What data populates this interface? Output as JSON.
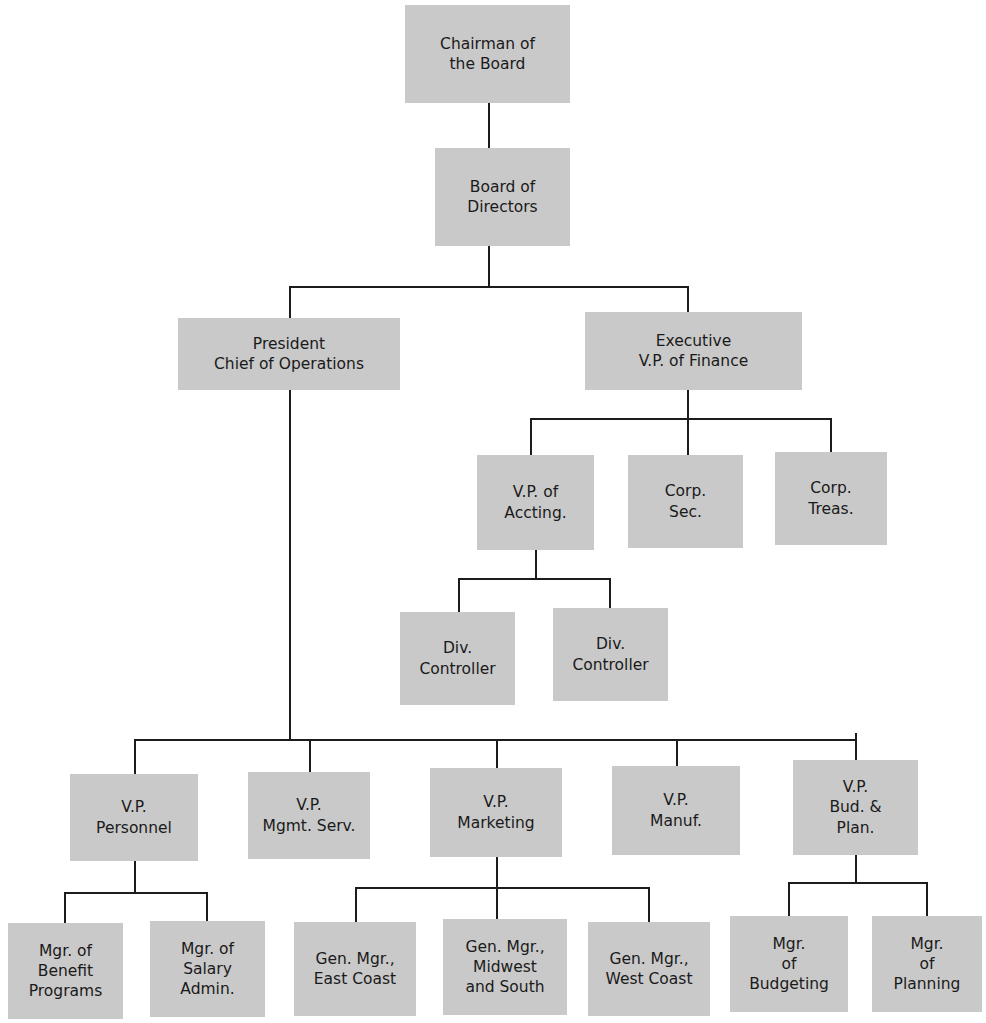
{
  "document": {
    "title": "Corporate Organization Chart",
    "type": "org-chart",
    "colors": {
      "node_fill": "#c9c9c9",
      "connector": "#1c1c1c",
      "background": "#ffffff",
      "text": "#1a1a1a"
    }
  },
  "nodes": {
    "chairman": {
      "label": "Chairman of\nthe Board",
      "x": 405,
      "y": 5,
      "w": 165,
      "h": 98
    },
    "board": {
      "label": "Board of\nDirectors",
      "x": 435,
      "y": 148,
      "w": 135,
      "h": 98
    },
    "president": {
      "label": "President\nChief of Operations",
      "x": 178,
      "y": 318,
      "w": 222,
      "h": 72
    },
    "exec_vp_finance": {
      "label": "Executive\nV.P. of Finance",
      "x": 585,
      "y": 312,
      "w": 217,
      "h": 78
    },
    "vp_accting": {
      "label": "V.P. of\nAccting.",
      "x": 477,
      "y": 455,
      "w": 117,
      "h": 95
    },
    "corp_sec": {
      "label": "Corp.\nSec.",
      "x": 628,
      "y": 455,
      "w": 115,
      "h": 93
    },
    "corp_treas": {
      "label": "Corp.\nTreas.",
      "x": 775,
      "y": 452,
      "w": 112,
      "h": 93
    },
    "div_controller_1": {
      "label": "Div.\nController",
      "x": 400,
      "y": 612,
      "w": 115,
      "h": 93
    },
    "div_controller_2": {
      "label": "Div.\nController",
      "x": 553,
      "y": 608,
      "w": 115,
      "h": 93
    },
    "vp_personnel": {
      "label": "V.P.\nPersonnel",
      "x": 70,
      "y": 774,
      "w": 128,
      "h": 87
    },
    "vp_mgmt_serv": {
      "label": "V.P.\nMgmt. Serv.",
      "x": 248,
      "y": 772,
      "w": 122,
      "h": 87
    },
    "vp_marketing": {
      "label": "V.P.\nMarketing",
      "x": 430,
      "y": 768,
      "w": 132,
      "h": 89
    },
    "vp_manuf": {
      "label": "V.P.\nManuf.",
      "x": 612,
      "y": 766,
      "w": 128,
      "h": 89
    },
    "vp_bud_plan": {
      "label": "V.P.\nBud. &\nPlan.",
      "x": 793,
      "y": 760,
      "w": 125,
      "h": 95
    },
    "mgr_benefit_programs": {
      "label": "Mgr. of\nBenefit\nPrograms",
      "x": 8,
      "y": 923,
      "w": 115,
      "h": 96
    },
    "mgr_salary_admin": {
      "label": "Mgr. of\nSalary\nAdmin.",
      "x": 150,
      "y": 921,
      "w": 115,
      "h": 96
    },
    "gen_mgr_east": {
      "label": "Gen. Mgr.,\nEast Coast",
      "x": 294,
      "y": 922,
      "w": 122,
      "h": 94
    },
    "gen_mgr_midwest": {
      "label": "Gen. Mgr.,\nMidwest\nand South",
      "x": 443,
      "y": 919,
      "w": 124,
      "h": 96
    },
    "gen_mgr_west": {
      "label": "Gen. Mgr.,\nWest Coast",
      "x": 588,
      "y": 922,
      "w": 122,
      "h": 94
    },
    "mgr_budgeting": {
      "label": "Mgr.\nof\nBudgeting",
      "x": 730,
      "y": 916,
      "w": 118,
      "h": 96
    },
    "mgr_planning": {
      "label": "Mgr.\nof\nPlanning",
      "x": 872,
      "y": 916,
      "w": 110,
      "h": 96
    }
  },
  "edges": [
    {
      "from": "chairman",
      "to": "board",
      "kind": "straight"
    },
    {
      "from": "board",
      "to": [
        "president",
        "exec_vp_finance"
      ],
      "kind": "bus"
    },
    {
      "from": "exec_vp_finance",
      "to": [
        "vp_accting",
        "corp_sec",
        "corp_treas"
      ],
      "kind": "bus"
    },
    {
      "from": "vp_accting",
      "to": [
        "div_controller_1",
        "div_controller_2"
      ],
      "kind": "bus"
    },
    {
      "from": "president",
      "to": [
        "vp_personnel",
        "vp_mgmt_serv",
        "vp_marketing",
        "vp_manuf",
        "vp_bud_plan"
      ],
      "kind": "bus"
    },
    {
      "from": "vp_personnel",
      "to": [
        "mgr_benefit_programs",
        "mgr_salary_admin"
      ],
      "kind": "bus"
    },
    {
      "from": "vp_marketing",
      "to": [
        "gen_mgr_east",
        "gen_mgr_midwest",
        "gen_mgr_west"
      ],
      "kind": "bus"
    },
    {
      "from": "vp_bud_plan",
      "to": [
        "mgr_budgeting",
        "mgr_planning"
      ],
      "kind": "bus"
    }
  ],
  "connector_segments": [
    {
      "name": "chairman-to-board",
      "orient": "v",
      "x": 488,
      "y": 103,
      "len": 45
    },
    {
      "name": "board-stem-down",
      "orient": "v",
      "x": 488,
      "y": 246,
      "len": 42
    },
    {
      "name": "board-bus",
      "orient": "h",
      "x": 289,
      "y": 286,
      "len": 400
    },
    {
      "name": "board-drop-president",
      "orient": "v",
      "x": 289,
      "y": 286,
      "len": 32
    },
    {
      "name": "board-drop-execvp",
      "orient": "v",
      "x": 687,
      "y": 286,
      "len": 26
    },
    {
      "name": "execvp-stem-down",
      "orient": "v",
      "x": 687,
      "y": 390,
      "len": 30
    },
    {
      "name": "execvp-bus",
      "orient": "h",
      "x": 530,
      "y": 418,
      "len": 302
    },
    {
      "name": "execvp-drop-vpaccting",
      "orient": "v",
      "x": 530,
      "y": 418,
      "len": 37
    },
    {
      "name": "execvp-drop-corpsec",
      "orient": "v",
      "x": 687,
      "y": 418,
      "len": 37
    },
    {
      "name": "execvp-drop-corptreas",
      "orient": "v",
      "x": 830,
      "y": 418,
      "len": 34
    },
    {
      "name": "vpaccting-stem-down",
      "orient": "v",
      "x": 535,
      "y": 550,
      "len": 29
    },
    {
      "name": "vpaccting-bus",
      "orient": "h",
      "x": 458,
      "y": 578,
      "len": 153
    },
    {
      "name": "vpaccting-drop-div1",
      "orient": "v",
      "x": 458,
      "y": 578,
      "len": 34
    },
    {
      "name": "vpaccting-drop-div2",
      "orient": "v",
      "x": 609,
      "y": 578,
      "len": 30
    },
    {
      "name": "president-stem-down",
      "orient": "v",
      "x": 289,
      "y": 390,
      "len": 350
    },
    {
      "name": "president-bus",
      "orient": "h",
      "x": 134,
      "y": 739,
      "len": 722
    },
    {
      "name": "president-drop-personnel",
      "orient": "v",
      "x": 134,
      "y": 739,
      "len": 35
    },
    {
      "name": "president-drop-mgmtserv",
      "orient": "v",
      "x": 309,
      "y": 739,
      "len": 33
    },
    {
      "name": "president-drop-marketing",
      "orient": "v",
      "x": 496,
      "y": 739,
      "len": 29
    },
    {
      "name": "president-drop-manuf",
      "orient": "v",
      "x": 676,
      "y": 739,
      "len": 27
    },
    {
      "name": "president-drop-budplan",
      "orient": "v",
      "x": 855,
      "y": 733,
      "len": 27
    },
    {
      "name": "personnel-stem-down",
      "orient": "v",
      "x": 134,
      "y": 861,
      "len": 31
    },
    {
      "name": "personnel-bus",
      "orient": "h",
      "x": 64,
      "y": 892,
      "len": 143
    },
    {
      "name": "personnel-drop-benefit",
      "orient": "v",
      "x": 64,
      "y": 892,
      "len": 31
    },
    {
      "name": "personnel-drop-salary",
      "orient": "v",
      "x": 206,
      "y": 892,
      "len": 29
    },
    {
      "name": "marketing-stem-down",
      "orient": "v",
      "x": 496,
      "y": 857,
      "len": 30
    },
    {
      "name": "marketing-bus",
      "orient": "h",
      "x": 355,
      "y": 887,
      "len": 294
    },
    {
      "name": "marketing-drop-east",
      "orient": "v",
      "x": 355,
      "y": 887,
      "len": 35
    },
    {
      "name": "marketing-drop-midwest",
      "orient": "v",
      "x": 496,
      "y": 887,
      "len": 32
    },
    {
      "name": "marketing-drop-west",
      "orient": "v",
      "x": 648,
      "y": 887,
      "len": 35
    },
    {
      "name": "budplan-stem-down",
      "orient": "v",
      "x": 855,
      "y": 855,
      "len": 27
    },
    {
      "name": "budplan-bus",
      "orient": "h",
      "x": 788,
      "y": 882,
      "len": 139
    },
    {
      "name": "budplan-drop-budgeting",
      "orient": "v",
      "x": 788,
      "y": 882,
      "len": 34
    },
    {
      "name": "budplan-drop-planning",
      "orient": "v",
      "x": 926,
      "y": 882,
      "len": 34
    }
  ]
}
